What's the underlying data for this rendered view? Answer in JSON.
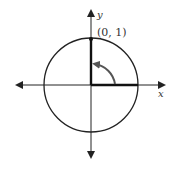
{
  "diagram": {
    "axes": {
      "x_label": "x",
      "y_label": "y"
    },
    "point": {
      "label": "(0, 1)",
      "x": 0,
      "y": 1
    },
    "angle_arrow": "counterclockwise arc from x-axis to y-axis (90°)",
    "colors": {
      "stroke": "#222222",
      "arc": "#555555"
    }
  }
}
